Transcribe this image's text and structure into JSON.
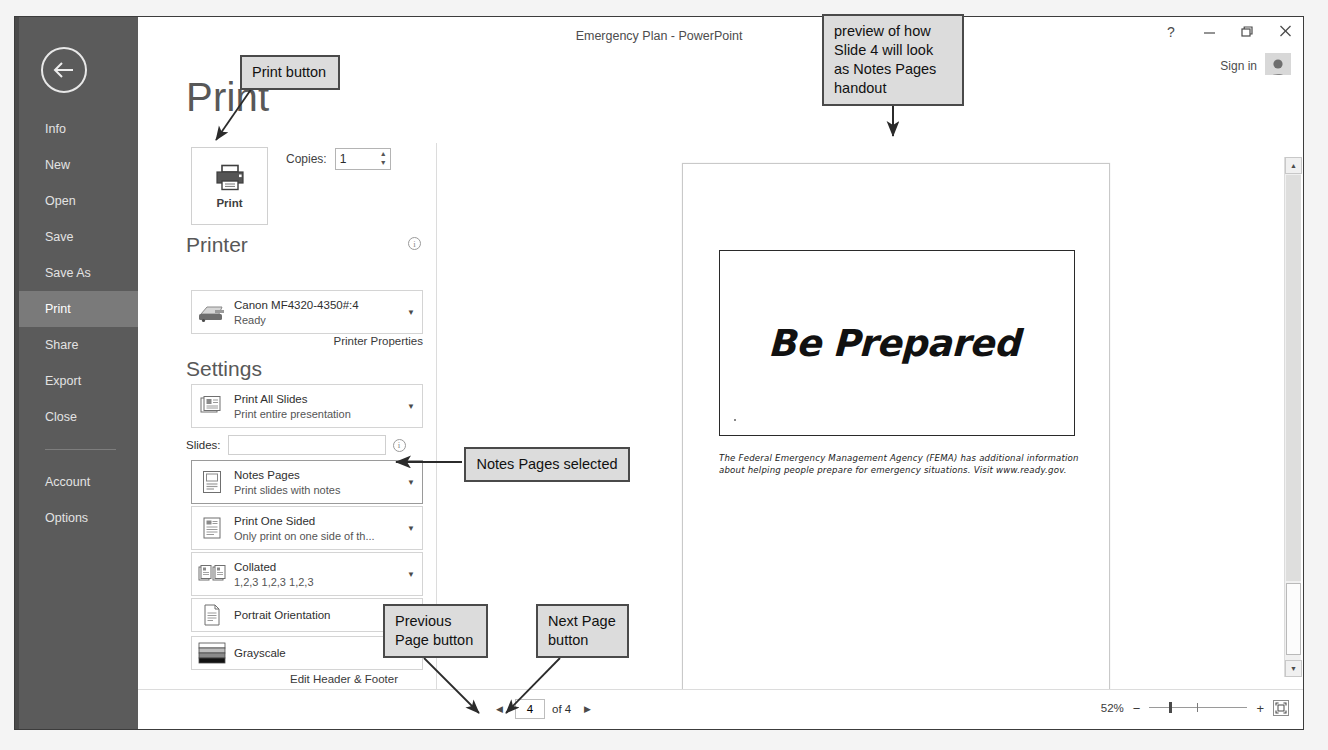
{
  "window": {
    "title": "Emergency Plan - PowerPoint",
    "help_icon": "?",
    "minimize_icon": "–",
    "restore_icon": "❐",
    "close_icon": "✕",
    "signin_label": "Sign in"
  },
  "sidebar": {
    "back_label": "Back",
    "items": [
      {
        "label": "Info",
        "active": false
      },
      {
        "label": "New",
        "active": false
      },
      {
        "label": "Open",
        "active": false
      },
      {
        "label": "Save",
        "active": false
      },
      {
        "label": "Save As",
        "active": false
      },
      {
        "label": "Print",
        "active": true
      },
      {
        "label": "Share",
        "active": false
      },
      {
        "label": "Export",
        "active": false
      },
      {
        "label": "Close",
        "active": false
      }
    ],
    "items_after_divider": [
      {
        "label": "Account"
      },
      {
        "label": "Options"
      }
    ]
  },
  "print_panel": {
    "heading": "Print",
    "print_button_label": "Print",
    "copies_label": "Copies:",
    "copies_value": "1",
    "printer_section_title": "Printer",
    "printer_name": "Canon MF4320-4350#:4",
    "printer_status": "Ready",
    "printer_properties_link": "Printer Properties",
    "settings_section_title": "Settings",
    "slides_label": "Slides:",
    "slides_value": "",
    "edit_header_footer_link": "Edit Header & Footer",
    "settings": [
      {
        "title": "Print All Slides",
        "subtitle": "Print entire presentation",
        "icon": "slides-stack-icon"
      },
      {
        "title": "Notes Pages",
        "subtitle": "Print slides with notes",
        "icon": "notes-page-icon"
      },
      {
        "title": "Print One Sided",
        "subtitle": "Only print on one side of th...",
        "icon": "one-sided-icon"
      },
      {
        "title": "Collated",
        "subtitle": "1,2,3   1,2,3   1,2,3",
        "icon": "collated-icon"
      },
      {
        "title": "Portrait Orientation",
        "subtitle": "",
        "icon": "portrait-icon"
      },
      {
        "title": "Grayscale",
        "subtitle": "",
        "icon": "grayscale-swatch-icon"
      }
    ]
  },
  "preview": {
    "slide_title": "Be Prepared",
    "notes_text": "The Federal Emergency Management Agency (FEMA) has additional information about helping people prepare for emergency situations. Visit www.ready.gov.",
    "page_marker": "4"
  },
  "statusbar": {
    "previous_page_icon": "◀",
    "next_page_icon": "▶",
    "current_page": "4",
    "of_text": "of 4",
    "zoom_percent": "52%",
    "zoom_out_icon": "−",
    "zoom_in_icon": "+",
    "fit_icon": "fit-slide-icon"
  },
  "annotations": [
    {
      "id": "print-button-callout",
      "text": "Print button"
    },
    {
      "id": "preview-callout",
      "text": "preview of how Slide 4 will look as Notes Pages handout"
    },
    {
      "id": "notes-pages-callout",
      "text": "Notes Pages selected"
    },
    {
      "id": "previous-page-callout",
      "text": "Previous Page button"
    },
    {
      "id": "next-page-callout",
      "text": "Next Page button"
    }
  ],
  "colors": {
    "rail_bg": "#5b5b5b",
    "rail_active": "#7a7a7a",
    "callout_bg": "#dcdcdc",
    "callout_border": "#4a4a4a"
  }
}
